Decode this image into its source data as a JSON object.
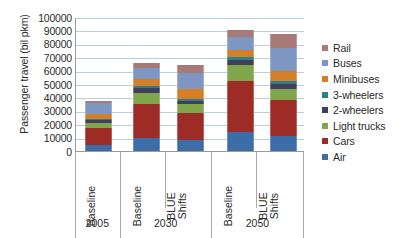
{
  "chart_data": {
    "type": "bar",
    "stacked": true,
    "title": "",
    "xlabel": "",
    "ylabel": "Passenger travel (bil pkm)",
    "ylim": [
      0,
      100000
    ],
    "ytick_labels": [
      "100000",
      "90000",
      "80000",
      "70000",
      "60000",
      "50000",
      "40000",
      "30000",
      "20000",
      "10000",
      "0"
    ],
    "ytick_values": [
      100000,
      90000,
      80000,
      70000,
      60000,
      50000,
      40000,
      30000,
      20000,
      10000,
      0
    ],
    "grid": true,
    "legend_position": "right",
    "categories": [
      "Baseline",
      "Baseline",
      "BLUE Shifts",
      "Baseline",
      "BLUE Shifts"
    ],
    "group_labels": [
      "2005",
      "2030",
      "2050"
    ],
    "group_spans": [
      1,
      2,
      2
    ],
    "series": [
      {
        "name": "Air",
        "color": "#3d6da8",
        "values": [
          4500,
          10000,
          8500,
          14500,
          11000
        ]
      },
      {
        "name": "Cars",
        "color": "#9e2c26",
        "values": [
          12500,
          25000,
          20000,
          37500,
          27000
        ]
      },
      {
        "name": "Light trucks",
        "color": "#7fa64a",
        "values": [
          4000,
          8000,
          6500,
          12000,
          8000
        ]
      },
      {
        "name": "2-wheelers",
        "color": "#3f3f5f",
        "values": [
          2000,
          4000,
          2500,
          4000,
          4000
        ]
      },
      {
        "name": "3-wheelers",
        "color": "#2e7f88",
        "values": [
          1000,
          1500,
          1500,
          2000,
          2000
        ]
      },
      {
        "name": "Minibuses",
        "color": "#d57f28",
        "values": [
          3500,
          5500,
          7500,
          5500,
          8000
        ]
      },
      {
        "name": "Buses",
        "color": "#7d96c2",
        "values": [
          8000,
          8000,
          12000,
          9500,
          17000
        ]
      },
      {
        "name": "Rail",
        "color": "#a87a76",
        "values": [
          2000,
          3500,
          5500,
          5000,
          10000
        ]
      }
    ],
    "totals": [
      37500,
      65500,
      64000,
      90000,
      87000
    ],
    "legend_order": [
      "Rail",
      "Buses",
      "Minibuses",
      "3-wheelers",
      "2-wheelers",
      "Light trucks",
      "Cars",
      "Air"
    ]
  },
  "legend": {
    "items": [
      {
        "label": "Rail",
        "color": "#a87a76"
      },
      {
        "label": "Buses",
        "color": "#7d96c2"
      },
      {
        "label": "Minibuses",
        "color": "#d57f28"
      },
      {
        "label": "3-wheelers",
        "color": "#2e7f88"
      },
      {
        "label": "2-wheelers",
        "color": "#3f3f5f"
      },
      {
        "label": "Light trucks",
        "color": "#7fa64a"
      },
      {
        "label": "Cars",
        "color": "#9e2c26"
      },
      {
        "label": "Air",
        "color": "#3d6da8"
      }
    ]
  },
  "axes": {
    "y_title": "Passenger travel (bil pkm)"
  }
}
